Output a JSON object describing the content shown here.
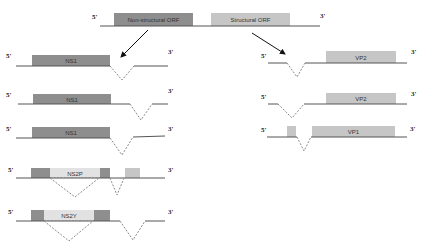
{
  "colors": {
    "nonstructural": "#8e8e8e",
    "structural": "#c6c6c6",
    "ns2_region": "#e2e2e2",
    "line": "#555555",
    "splice": "#8a8a8a",
    "arrow": "#111111"
  },
  "genome": {
    "five_prime": "5'",
    "three_prime": "3'",
    "nonstructural_orf": "Non-structural ORF",
    "structural_orf": "Structural ORF"
  },
  "nonstructural_transcripts": [
    {
      "five_prime": "5'",
      "three_prime": "3'",
      "label": "NS1"
    },
    {
      "five_prime": "5'",
      "three_prime": "3'",
      "label": "NS1"
    },
    {
      "five_prime": "5'",
      "three_prime": "3'",
      "label": "NS1"
    },
    {
      "five_prime": "5'",
      "three_prime": "3'",
      "label": "NS2P"
    },
    {
      "five_prime": "5'",
      "three_prime": "3'",
      "label": "NS2Y"
    }
  ],
  "structural_transcripts": [
    {
      "five_prime": "5'",
      "three_prime": "3'",
      "label": "VP2"
    },
    {
      "five_prime": "5'",
      "three_prime": "3'",
      "label": "VP2"
    },
    {
      "five_prime": "5'",
      "three_prime": "3'",
      "label": "VP1"
    }
  ]
}
